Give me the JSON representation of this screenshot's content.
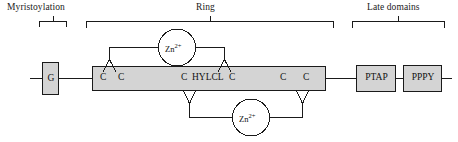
{
  "figure": {
    "type": "protein-domain-diagram",
    "title_absent": true
  },
  "headers": [
    {
      "id": "myristoylation",
      "label": "Myristoylation"
    },
    {
      "id": "ring",
      "label": "Ring"
    },
    {
      "id": "late-domains",
      "label": "Late domains"
    }
  ],
  "domains": [
    {
      "id": "g",
      "label": "G",
      "shape": "small-box",
      "fill": "#d4d4d4"
    },
    {
      "id": "ring-bar",
      "label": "",
      "shape": "long-bar",
      "fill": "#d4d4d4"
    },
    {
      "id": "ptap",
      "label": "PTAP",
      "shape": "box",
      "fill": "#d4d4d4"
    },
    {
      "id": "pppy",
      "label": "PPPY",
      "shape": "box",
      "fill": "#d4d4d4"
    }
  ],
  "residues": [
    {
      "id": "c1",
      "label": "C"
    },
    {
      "id": "c2",
      "label": "C"
    },
    {
      "id": "c3",
      "label": "C"
    },
    {
      "id": "hylcl",
      "label": "HYLCL"
    },
    {
      "id": "c4",
      "label": "C"
    },
    {
      "id": "c5",
      "label": "C"
    },
    {
      "id": "c6",
      "label": "C"
    }
  ],
  "cofactors": [
    {
      "id": "zn-top",
      "element": "Zn",
      "charge": "2+",
      "position": "above-bar"
    },
    {
      "id": "zn-bottom",
      "element": "Zn",
      "charge": "2+",
      "position": "below-bar"
    }
  ],
  "colors": {
    "stroke": "#1a1a1a",
    "box_fill": "#d4d4d4",
    "bar_fill": "#d4d4d4",
    "text": "#111111",
    "background": "#ffffff"
  }
}
